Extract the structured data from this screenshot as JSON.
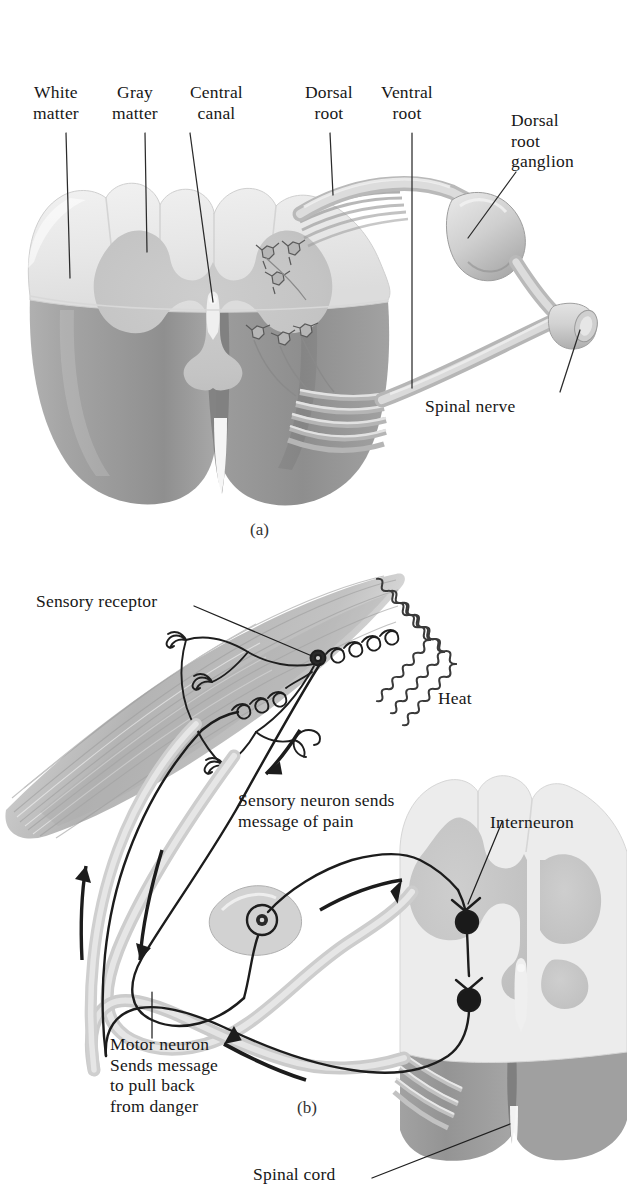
{
  "figure": {
    "panels": [
      {
        "id": "a",
        "caption": "(a)"
      },
      {
        "id": "b",
        "caption": "(b)"
      }
    ]
  },
  "panel_a": {
    "caption": "(a)",
    "labels": {
      "white_matter": "White\nmatter",
      "gray_matter": "Gray\nmatter",
      "central_canal": "Central\ncanal",
      "dorsal_root": "Dorsal\nroot",
      "ventral_root": "Ventral\nroot",
      "dorsal_root_ganglion": "Dorsal\nroot\nganglion",
      "spinal_nerve": "Spinal nerve"
    }
  },
  "panel_b": {
    "caption": "(b)",
    "labels": {
      "sensory_receptor": "Sensory receptor",
      "heat": "Heat",
      "sensory_neuron": "Sensory neuron sends\nmessage of pain",
      "interneuron": "Interneuron",
      "motor_neuron": "Motor neuron\nSends message\nto pull back\nfrom danger",
      "spinal_cord": "Spinal cord"
    }
  },
  "colors": {
    "white_matter": "#ebebeb",
    "gray_matter": "#c9c9c9",
    "cord_base": "#9d9d9d",
    "cord_base_dark": "#878787",
    "nerve": "#d2d2d2",
    "nerve_shade": "#b4b4b4",
    "muscle": "#b9b9b9",
    "muscle_light": "#d6d6d6",
    "ink": "#1a1a1a",
    "leader": "#2b2b2b",
    "background": "#ffffff"
  }
}
